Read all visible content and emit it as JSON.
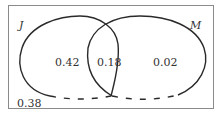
{
  "diagram": {
    "type": "venn",
    "sets": [
      {
        "label": "J",
        "only_value": "0.42"
      },
      {
        "label": "M",
        "only_value": "0.02"
      }
    ],
    "intersection_value": "0.18",
    "outside_value": "0.38"
  },
  "colors": {
    "stroke": "#2a2a2a",
    "frame": "#8a8a8a",
    "text": "#333333"
  }
}
